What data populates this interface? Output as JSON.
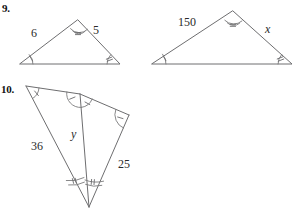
{
  "page": {
    "background": "#ffffff",
    "ink_color": "#6e6e70",
    "text_color": "#1a1a1a"
  },
  "problems": [
    {
      "number": "9.",
      "figures": [
        {
          "name": "left-triangle",
          "side_labels": [
            "6",
            "5"
          ],
          "angle_marks": {
            "apex": "double-arc-with-tick",
            "base_left": "single-arc-with-tick",
            "base_right": "single-arc-with-tick"
          }
        },
        {
          "name": "right-triangle",
          "side_labels": [
            "150",
            "x"
          ],
          "angle_marks": {
            "apex": "double-arc-with-tick",
            "base_left": "single-arc-with-tick",
            "base_right": "single-arc-with-tick"
          }
        }
      ]
    },
    {
      "number": "10.",
      "figures": [
        {
          "name": "overlapping-triangles",
          "side_labels": [
            "36",
            "25",
            "y"
          ],
          "angle_marks": {
            "top_left": "single-arc-with-tick",
            "top_middle_left": "single-arc-with-tick",
            "top_middle_right": "single-arc-with-tick",
            "right": "single-arc-with-tick",
            "bottom_left": "double-arc-with-tick",
            "bottom_right": "double-arc-with-tick"
          }
        }
      ]
    }
  ],
  "labels": {
    "num9": "9.",
    "num10": "10.",
    "six": "6",
    "five": "5",
    "oneFifty": "150",
    "x": "x",
    "thirtySix": "36",
    "twentyFive": "25",
    "y": "y"
  }
}
